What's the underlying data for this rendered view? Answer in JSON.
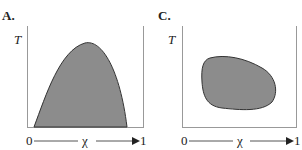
{
  "panels": [
    {
      "label": "A.",
      "y_axis": "T",
      "x_axis": {
        "start": "0",
        "symbol": "χ",
        "end": "1"
      },
      "shape": "dome-shaped shaded region rising from x-axis, peak right of center"
    },
    {
      "label": "C.",
      "y_axis": "T",
      "x_axis": {
        "start": "0",
        "symbol": "χ",
        "end": "1"
      },
      "shape": "closed rounded blob (island) shaded region"
    }
  ],
  "colors": {
    "fill": "#8c8c8c",
    "stroke": "#333333",
    "axis": "#999999"
  }
}
